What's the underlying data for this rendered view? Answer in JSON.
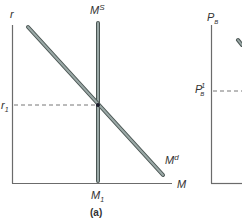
{
  "figure": {
    "panel_a": {
      "caption": "(a)",
      "y_axis_label": "r",
      "x_axis_label": "M",
      "supply_label_base": "M",
      "supply_label_sup": "S",
      "demand_label_base": "M",
      "demand_label_sup": "d",
      "r1_label_base": "r",
      "r1_label_sub": "1",
      "m1_label_base": "M",
      "m1_label_sub": "1"
    },
    "panel_b": {
      "y_axis_label_base": "P",
      "y_axis_label_sub": "B",
      "pb1_label_base": "P",
      "pb1_label_sub": "B",
      "pb1_label_sup": "1"
    },
    "colors": {
      "axis": "#6b6b6b",
      "curve_fill": "#9aa8a6",
      "curve_outline": "#4a5553",
      "dashed": "#777777",
      "dot": "#1a1a2a"
    }
  }
}
